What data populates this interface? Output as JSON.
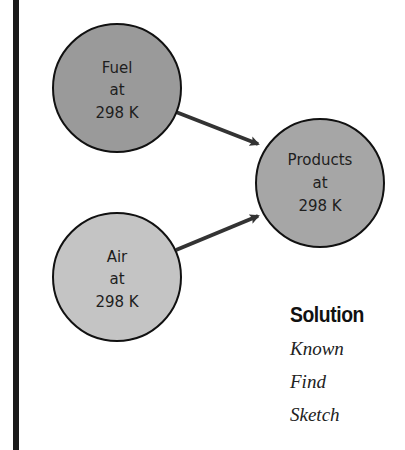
{
  "diagram": {
    "nodes": [
      {
        "id": "fuel",
        "lines": [
          "Fuel",
          "at",
          "298 K"
        ],
        "fill": "#9a9a9a",
        "cx": 117,
        "cy": 88,
        "r": 64
      },
      {
        "id": "air",
        "lines": [
          "Air",
          "at",
          "298 K"
        ],
        "fill": "#c4c4c4",
        "cx": 117,
        "cy": 277,
        "r": 64
      },
      {
        "id": "products",
        "lines": [
          "Products",
          "at",
          "298 K"
        ],
        "fill": "#a6a6a6",
        "cx": 320,
        "cy": 183,
        "r": 64
      }
    ],
    "edges": [
      {
        "from": "fuel",
        "to": "products"
      },
      {
        "from": "air",
        "to": "products"
      }
    ]
  },
  "solution": {
    "title": "Solution",
    "items": [
      "Known",
      "Find",
      "Sketch"
    ]
  },
  "colors": {
    "stroke": "#111111",
    "arrow": "#333333"
  }
}
